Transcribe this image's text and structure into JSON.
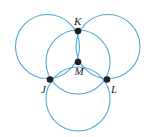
{
  "figure": {
    "canvas": {
      "width": 152,
      "height": 137,
      "background": "#ffffff"
    },
    "style": {
      "stroke_color": "#4ea8d8",
      "stroke_width": 1.1,
      "point_color": "#231f20",
      "point_size": 3.3,
      "label_color": "#231f20"
    },
    "circles": [
      {
        "name": "upper-left-circle",
        "cx": 47.5,
        "cy": 46.5,
        "r": 32.0
      },
      {
        "name": "upper-right-circle",
        "cx": 108.0,
        "cy": 46.5,
        "r": 32.0
      },
      {
        "name": "bottom-circle",
        "cx": 78.0,
        "cy": 99.0,
        "r": 32.0
      },
      {
        "name": "middle-circle",
        "cx": 78.0,
        "cy": 62.0,
        "r": 32.0
      }
    ],
    "points": [
      {
        "name": "point-K",
        "label": "K",
        "x": 78.0,
        "y": 31.0,
        "label_dx": -4.0,
        "label_dy": -15.0
      },
      {
        "name": "point-M",
        "label": "M",
        "x": 78.0,
        "y": 62.0,
        "label_dx": -3.5,
        "label_dy": 4.0
      },
      {
        "name": "point-J",
        "label": "J",
        "x": 50.0,
        "y": 79.5,
        "label_dx": -9.0,
        "label_dy": 4.0
      },
      {
        "name": "point-L",
        "label": "L",
        "x": 107.0,
        "y": 79.5,
        "label_dx": 4.0,
        "label_dy": 4.0
      }
    ]
  },
  "chart_data": {
    "type": "diagram",
    "labels": [
      "K",
      "M",
      "J",
      "L"
    ],
    "circle_count": 4,
    "radius": 32,
    "centers": [
      [
        47.5,
        46.5
      ],
      [
        108.0,
        46.5
      ],
      [
        78.0,
        99.0
      ],
      [
        78.0,
        62.0
      ]
    ],
    "marked_points": [
      [
        78.0,
        31.0
      ],
      [
        78.0,
        62.0
      ],
      [
        50.0,
        79.5
      ],
      [
        107.0,
        79.5
      ]
    ]
  }
}
